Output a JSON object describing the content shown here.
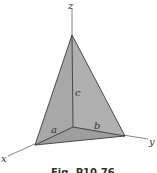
{
  "figure": {
    "caption": "Fig. P10.76",
    "axes": {
      "x": "x",
      "y": "y",
      "z": "z"
    },
    "edges": {
      "a": "a",
      "b": "b",
      "c": "c"
    },
    "colors": {
      "face": "#a9a9a9",
      "face_dark": "#9b9b9b",
      "line": "#3a3a3a",
      "axis": "#555555"
    }
  }
}
